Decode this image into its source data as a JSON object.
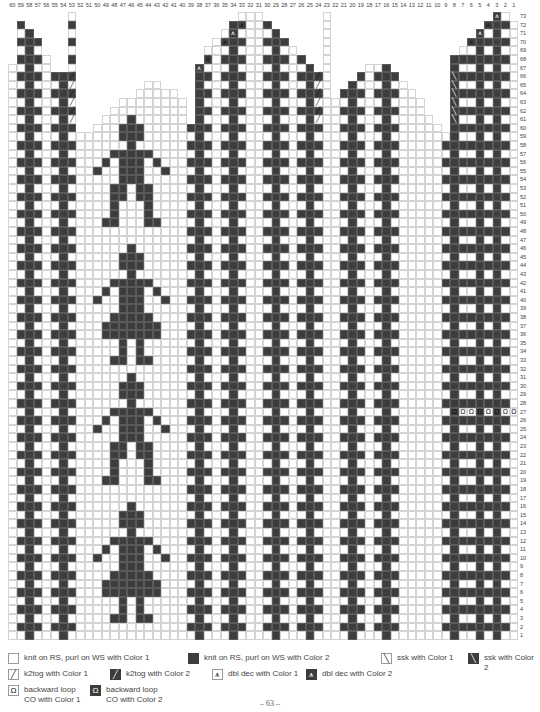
{
  "chart": {
    "columns": 60,
    "rows": 73,
    "column_labels_left_to_right": [
      60,
      59,
      58,
      57,
      56,
      55,
      54,
      53,
      52,
      51,
      50,
      49,
      48,
      47,
      46,
      45,
      44,
      43,
      42,
      41,
      40,
      39,
      38,
      37,
      36,
      35,
      34,
      33,
      32,
      31,
      30,
      29,
      28,
      27,
      26,
      25,
      24,
      23,
      22,
      21,
      20,
      19,
      18,
      17,
      16,
      15,
      14,
      13,
      12,
      11,
      10,
      9,
      8,
      7,
      6,
      5,
      4,
      3,
      2,
      1
    ],
    "row_labels_bottom_to_top": "1-73",
    "colors": {
      "color1": "#ffffff",
      "color2": "#3d3d3d",
      "grid": "#d4d4d4"
    },
    "outline": {
      "description": "Column tops (highest row present) per stitch, left to right (60..1)",
      "tops": [
        67,
        72,
        71,
        70,
        68,
        66,
        66,
        0,
        59,
        59,
        60,
        61,
        62,
        63,
        63,
        64,
        65,
        65,
        64,
        64,
        63,
        60,
        67,
        69,
        70,
        71,
        72,
        73,
        73,
        73,
        72,
        71,
        70,
        69,
        68,
        67,
        66,
        0,
        63,
        64,
        65,
        66,
        67,
        67,
        67,
        66,
        65,
        64,
        63,
        61,
        60,
        59,
        68,
        69,
        70,
        71,
        72,
        73,
        73,
        72
      ]
    },
    "regions": [
      {
        "name": "left-thumb-gusset",
        "stitches": "60-53",
        "pattern": "cross"
      },
      {
        "name": "figure-panel",
        "stitches": "52-41",
        "pattern": "figures"
      },
      {
        "name": "back-of-hand",
        "stitches": "40-25",
        "pattern": "cross"
      },
      {
        "name": "palm-arch",
        "stitches": "24-9",
        "pattern": "cross"
      },
      {
        "name": "right-edge",
        "stitches": "8-1",
        "pattern": "cross"
      }
    ],
    "special_rows": {
      "backward_loop_row": 27,
      "backward_loop_stitches": [
        8,
        7,
        6,
        5,
        4,
        3,
        2,
        1
      ]
    }
  },
  "legend": [
    {
      "key": "knit-color1",
      "swatch": "w",
      "glyph": "",
      "label": "knit on RS, purl on WS with Color 1"
    },
    {
      "key": "knit-color2",
      "swatch": "d",
      "glyph": "",
      "label": "knit on RS, purl on WS with Color 2"
    },
    {
      "key": "ssk-color1",
      "swatch": "w",
      "glyph": "╲",
      "label": "ssk with Color 1"
    },
    {
      "key": "ssk-color2",
      "swatch": "d",
      "glyph": "╲",
      "label": "ssk with Color 2"
    },
    {
      "key": "k2tog-color1",
      "swatch": "w",
      "glyph": "╱",
      "label": "k2tog with Color 1"
    },
    {
      "key": "k2tog-color2",
      "swatch": "d",
      "glyph": "╱",
      "label": "k2tog with Color 2"
    },
    {
      "key": "dbl-dec-color1",
      "swatch": "w",
      "glyph": "⩚",
      "label": "dbl dec with Color 1"
    },
    {
      "key": "dbl-dec-color2",
      "swatch": "d",
      "glyph": "⩚",
      "label": "dbl dec with Color 2"
    },
    {
      "key": "backward-loop-color1",
      "swatch": "w",
      "glyph": "Ω",
      "label": "backward loop\nCO with Color 1"
    },
    {
      "key": "backward-loop-color2",
      "swatch": "d",
      "glyph": "Ω",
      "label": "backward loop\nCO with Color 2"
    }
  ],
  "page_number": "– 63 –"
}
